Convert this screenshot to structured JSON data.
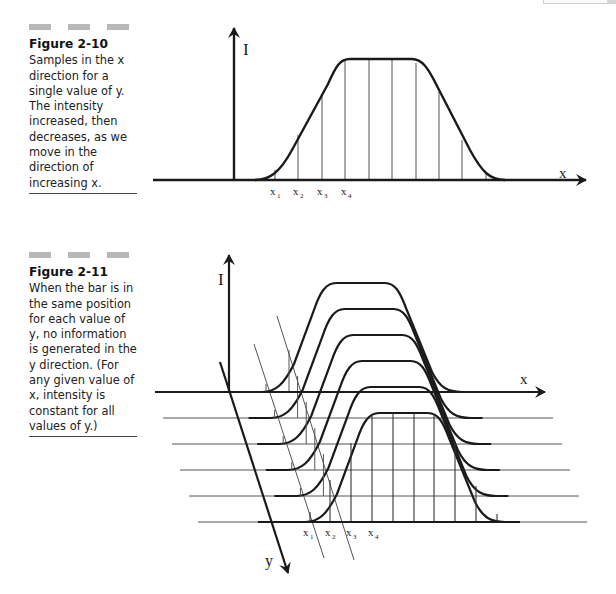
{
  "figure_2_10": {
    "number": "Figure 2-10",
    "caption": "Samples in the x direction for a single value of y. The intensity increased, then decreases, as we move in the direction of increasing x.",
    "axis_vertical_label": "I",
    "axis_horizontal_label": "x",
    "sample_labels": [
      "x",
      "x",
      "x",
      "x"
    ],
    "sample_subscripts": [
      "1",
      "2",
      "3",
      "4"
    ]
  },
  "figure_2_11": {
    "number": "Figure 2-11",
    "caption": "When the bar is in the same position for each value of y, no information is generated in the y direction. (For any given value of x, intensity is constant for all values of y.)",
    "axis_vertical_label": "I",
    "axis_horizontal_label": "x",
    "axis_depth_label": "y",
    "sample_labels": [
      "x",
      "x",
      "x",
      "x"
    ],
    "sample_subscripts": [
      "1",
      "2",
      "3",
      "4"
    ],
    "layers": 6
  },
  "colors": {
    "ink": "#1a1a1a",
    "thin_line": "#555555",
    "caption_bar": "#b8b8b8"
  }
}
